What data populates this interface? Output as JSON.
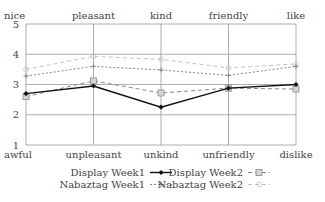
{
  "chart_data": {
    "type": "line",
    "title": "",
    "categories_top": [
      "nice",
      "pleasant",
      "kind",
      "friendly",
      "like"
    ],
    "categories_bottom": [
      "awful",
      "unpleasant",
      "unkind",
      "unfriendly",
      "dislike"
    ],
    "yticks": [
      1,
      2,
      3,
      4,
      5
    ],
    "ylim": [
      1,
      5
    ],
    "grid": true,
    "legend_position": "bottom",
    "series": [
      {
        "name": "Display Week1",
        "style": "solid",
        "marker": "diamond",
        "color": "#111111",
        "values": [
          2.7,
          2.95,
          2.25,
          2.88,
          3.0
        ]
      },
      {
        "name": "Display Week2",
        "style": "dashed",
        "marker": "square",
        "color": "#888888",
        "values": [
          2.6,
          3.12,
          2.72,
          2.88,
          2.85
        ]
      },
      {
        "name": "Nabaztag Week1",
        "style": "dotted",
        "marker": "plus",
        "color": "#888888",
        "values": [
          3.28,
          3.6,
          3.48,
          3.3,
          3.6
        ]
      },
      {
        "name": "Nabaztag Week2",
        "style": "dashed-light",
        "marker": "circle",
        "color": "#c4c4c4",
        "values": [
          3.5,
          3.93,
          3.83,
          3.55,
          3.68
        ]
      }
    ]
  }
}
